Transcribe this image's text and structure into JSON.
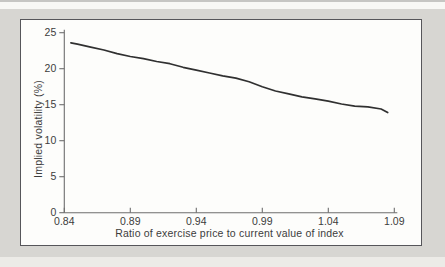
{
  "figure": {
    "kind": "scanned textbook line chart, no title, no legend"
  },
  "colors": {
    "page_background": "#d7d6d2",
    "top_strip": "#f8f8f5",
    "bottom_strip": "#ecebe7",
    "panel_background": "#fdfdfb",
    "panel_border": "#56565a",
    "axis": "#6e6e6e",
    "tick_text": "#3c3c3c",
    "curve": "#303030"
  },
  "chart_data": {
    "type": "line",
    "title": "",
    "xlabel": "Ratio of exercise price to current value of index",
    "ylabel": "Implied volatility (%)",
    "xlim": [
      0.84,
      1.09
    ],
    "ylim": [
      0,
      25
    ],
    "xticks": [
      "0.84",
      "0.89",
      "0.94",
      "0.99",
      "1.04",
      "1.09"
    ],
    "yticks": [
      "0",
      "5",
      "10",
      "15",
      "20",
      "25"
    ],
    "grid": false,
    "legend": null,
    "series": [
      {
        "name": "implied-volatility-curve",
        "x": [
          0.845,
          0.85,
          0.86,
          0.87,
          0.88,
          0.89,
          0.9,
          0.91,
          0.92,
          0.93,
          0.94,
          0.95,
          0.96,
          0.97,
          0.98,
          0.99,
          1.0,
          1.01,
          1.02,
          1.03,
          1.04,
          1.05,
          1.06,
          1.07,
          1.08,
          1.085
        ],
        "y": [
          23.6,
          23.4,
          23.0,
          22.6,
          22.1,
          21.7,
          21.4,
          21.0,
          20.7,
          20.2,
          19.8,
          19.4,
          19.0,
          18.7,
          18.2,
          17.5,
          16.9,
          16.5,
          16.1,
          15.8,
          15.5,
          15.1,
          14.8,
          14.7,
          14.4,
          13.9
        ]
      }
    ]
  }
}
